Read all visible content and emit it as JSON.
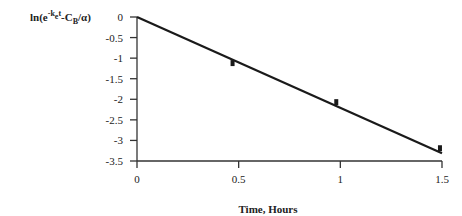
{
  "chart_data": {
    "type": "line",
    "title": "",
    "xlabel": "Time, Hours",
    "ylabel": "ln(e^-k_e t - C_B/α)",
    "ylabel_parts": {
      "pre": "ln(e",
      "sup": "-k",
      "sup2": "e",
      "sup3": "t",
      "mid": "-C",
      "sub": "B",
      "post": "/α)"
    },
    "xlim": [
      0,
      1.5
    ],
    "ylim": [
      -3.5,
      0
    ],
    "xticks": [
      0,
      0.5,
      1,
      1.5
    ],
    "xtick_labels": [
      "0",
      "0.5",
      "1",
      "1.5"
    ],
    "yticks": [
      0,
      -0.5,
      -1,
      -1.5,
      -2,
      -2.5,
      -3,
      -3.5
    ],
    "ytick_labels": [
      "0",
      "-0.5",
      "-1",
      "-1.5",
      "-2",
      "-2.5",
      "-3",
      "-3.5"
    ],
    "grid": false,
    "legend": null,
    "series": [
      {
        "name": "fit line",
        "style": "line",
        "x": [
          0,
          1.5
        ],
        "y": [
          0,
          -3.31
        ]
      },
      {
        "name": "data",
        "style": "markers",
        "x": [
          0.47,
          0.98,
          1.49
        ],
        "y": [
          -1.12,
          -2.07,
          -3.19
        ]
      }
    ],
    "colors": {
      "line": "#1a1a1a",
      "axis": "#333333",
      "marker": "#1a1a1a"
    }
  }
}
